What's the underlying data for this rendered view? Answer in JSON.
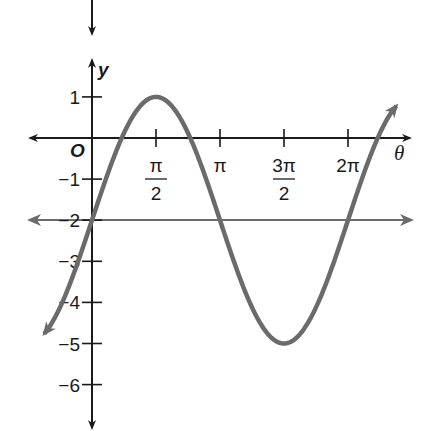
{
  "chart_data": {
    "type": "line",
    "title": "",
    "function": "y = 3 sin(theta) - 2",
    "xlabel": "θ",
    "ylabel": "y",
    "origin_label": "O",
    "x_ticks": [
      {
        "value": 1.5708,
        "label_num": "π",
        "label_den": "2"
      },
      {
        "value": 3.1416,
        "label_num": "π",
        "label_den": ""
      },
      {
        "value": 4.7124,
        "label_num": "3π",
        "label_den": "2"
      },
      {
        "value": 6.2832,
        "label_num": "2π",
        "label_den": ""
      }
    ],
    "y_ticks": [
      {
        "value": 1,
        "label": "1"
      },
      {
        "value": -1,
        "label": "−1"
      },
      {
        "value": -2,
        "label": "−2"
      },
      {
        "value": -3,
        "label": "−3"
      },
      {
        "value": -4,
        "label": "−4"
      },
      {
        "value": -5,
        "label": "−5"
      },
      {
        "value": -6,
        "label": "−6"
      }
    ],
    "xlim": [
      -1.5,
      7.8
    ],
    "ylim": [
      -7,
      2
    ],
    "grid": false,
    "series": [
      {
        "name": "3 sin θ − 2",
        "color": "#6b6b6b",
        "points": [
          {
            "x": 0,
            "y": -2
          },
          {
            "x": 0.5236,
            "y": -0.5
          },
          {
            "x": 1.5708,
            "y": 1
          },
          {
            "x": 2.618,
            "y": -0.5
          },
          {
            "x": 3.1416,
            "y": -2
          },
          {
            "x": 4.7124,
            "y": -5
          },
          {
            "x": 6.2832,
            "y": -2
          }
        ]
      },
      {
        "name": "midline y = −2",
        "color": "#6b6b6b",
        "points": [
          {
            "x": -1.5,
            "y": -2
          },
          {
            "x": 7.8,
            "y": -2
          }
        ]
      }
    ],
    "annotations": {
      "maximum": {
        "x": "π/2",
        "y": 1
      },
      "minimum": {
        "x": "3π/2",
        "y": -5
      },
      "midline": -2
    }
  },
  "colors": {
    "axis": "#1a1a1a",
    "curve": "#6b6b6b",
    "background": "#ffffff"
  }
}
